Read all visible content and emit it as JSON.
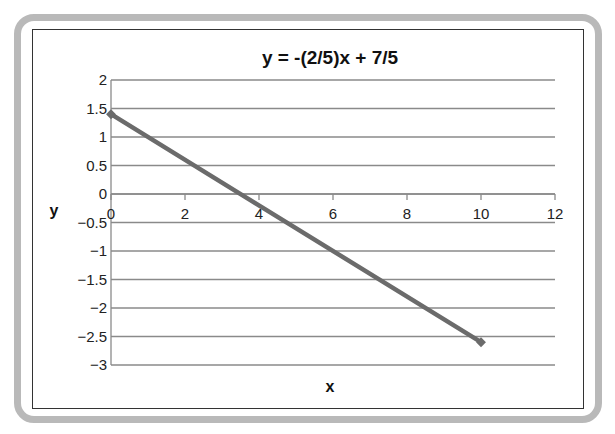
{
  "chart_data": {
    "type": "line",
    "title": "y = -(2/5)x + 7/5",
    "xlabel": "x",
    "ylabel": "y",
    "xlim": [
      0,
      12
    ],
    "ylim": [
      -3,
      2
    ],
    "x_ticks": [
      "0",
      "2",
      "4",
      "6",
      "8",
      "10",
      "12"
    ],
    "y_ticks": [
      "2",
      "1.5",
      "1",
      "0.5",
      "0",
      "−0.5",
      "−1",
      "−1.5",
      "−2",
      "−2.5",
      "−3"
    ],
    "grid": {
      "horizontal": true,
      "vertical": false
    },
    "legend": null,
    "series": [
      {
        "name": "y = -(2/5)x + 7/5",
        "color": "#6b6b6b",
        "points": [
          {
            "x": 0,
            "y": 1.4
          },
          {
            "x": 10,
            "y": -2.6
          }
        ]
      }
    ]
  },
  "colors": {
    "frame": "#b9b9b9",
    "border": "#333333",
    "grid": "#8a8a8a",
    "line": "#6b6b6b"
  }
}
